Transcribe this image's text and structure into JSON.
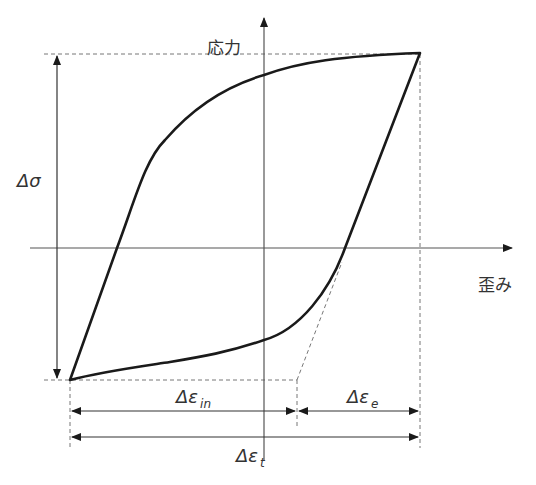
{
  "diagram": {
    "type": "stress-strain hysteresis loop",
    "axes": {
      "y_label": "応力",
      "x_label": "歪み"
    },
    "annotations": {
      "delta_sigma": {
        "symbol": "Δσ"
      },
      "delta_eps_in": {
        "symbol": "Δε",
        "subscript": "in"
      },
      "delta_eps_e": {
        "symbol": "Δε",
        "subscript": "e"
      },
      "delta_eps_t": {
        "symbol": "Δε",
        "subscript": "t"
      }
    },
    "colors": {
      "curve": "#1a1a1a",
      "axis": "#555555",
      "dashed": "#777777",
      "text": "#333333"
    }
  }
}
